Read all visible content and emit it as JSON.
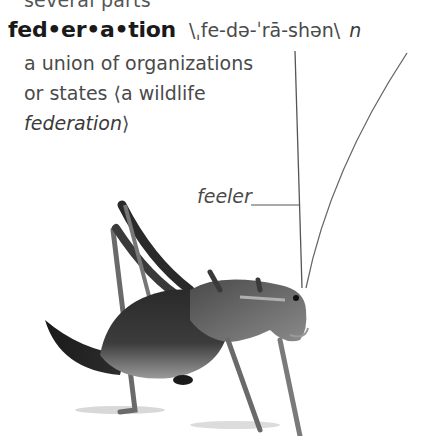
{
  "previous_entry": {
    "tail_text": "several parts"
  },
  "entry": {
    "headword": "fed•er•a•tion",
    "pronunciation": "\\ˌfe-də-ˈrā-shən\\",
    "part_of_speech": "n",
    "definition_lines": [
      "a union of organizations",
      "or states"
    ],
    "example_open": "⟨a wildlife",
    "example_close": "federation⟩",
    "definition_line_2_prefix": "or states ",
    "example_text_line1": "⟨a wildlife",
    "example_text_line2": "federation",
    "example_close_bracket": "⟩"
  },
  "illustration": {
    "subject": "cricket",
    "labels": [
      {
        "text": "feeler",
        "points_to": "antenna"
      }
    ],
    "colors": {
      "ink": "#1a1a1a",
      "leader_line": "#555555",
      "body_dark": "#1e1e1e",
      "body_mid": "#555555",
      "body_light": "#8a8a8a"
    }
  }
}
